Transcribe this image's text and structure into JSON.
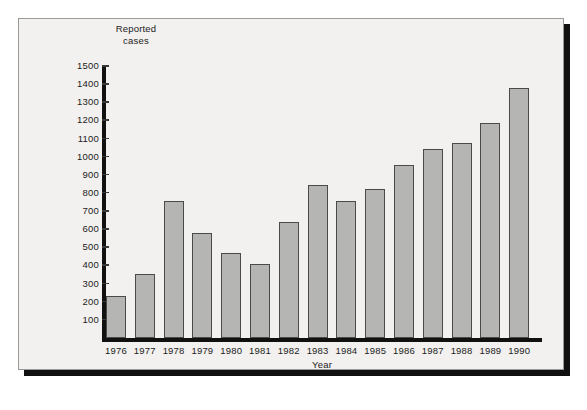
{
  "chart_data": {
    "type": "bar",
    "title": "",
    "xlabel": "Year",
    "ylabel": "Reported cases",
    "ylabel_lines": [
      "Reported",
      "cases"
    ],
    "categories": [
      "1976",
      "1977",
      "1978",
      "1979",
      "1980",
      "1981",
      "1982",
      "1983",
      "1984",
      "1985",
      "1986",
      "1987",
      "1988",
      "1989",
      "1990"
    ],
    "values": [
      230,
      355,
      755,
      580,
      470,
      410,
      640,
      845,
      755,
      820,
      955,
      1040,
      1075,
      1185,
      1380
    ],
    "ylim": [
      0,
      1500
    ],
    "yticks": [
      1500,
      1400,
      1300,
      1200,
      1100,
      1000,
      900,
      800,
      700,
      600,
      500,
      400,
      300,
      200,
      100
    ],
    "grid": false,
    "legend": null,
    "bar_color": "#b5b5b3",
    "bar_edge_color": "#4a4a48",
    "axis_color": "#111111",
    "background_color": "#f2f1ef"
  }
}
